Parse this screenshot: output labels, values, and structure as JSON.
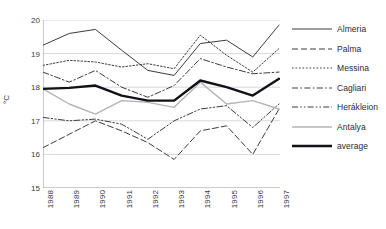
{
  "chart_data": {
    "type": "line",
    "title": "",
    "xlabel": "",
    "ylabel": "°C",
    "ylim": [
      15,
      20
    ],
    "yticks": [
      15,
      16,
      17,
      18,
      19,
      20
    ],
    "grid": true,
    "legend_position": "right",
    "categories": [
      "1988",
      "1989",
      "1990",
      "1991",
      "1992",
      "1993",
      "1994",
      "1995",
      "1996",
      "1997"
    ],
    "series": [
      {
        "name": "Almeria",
        "style": "solid",
        "color": "#3b3b44",
        "width": 1,
        "values": [
          19.25,
          19.6,
          19.72,
          19.1,
          18.5,
          18.35,
          19.3,
          19.4,
          18.9,
          19.85
        ]
      },
      {
        "name": "Palma",
        "style": "dashed",
        "color": "#3b3b44",
        "width": 1,
        "values": [
          16.2,
          16.6,
          17.0,
          16.7,
          16.35,
          15.85,
          16.7,
          16.85,
          16.0,
          17.35
        ]
      },
      {
        "name": "Messina",
        "style": "dotted",
        "color": "#3b3b44",
        "width": 1,
        "values": [
          18.65,
          18.8,
          18.75,
          18.6,
          18.7,
          18.55,
          19.55,
          18.95,
          18.45,
          19.15
        ]
      },
      {
        "name": "Cagliari",
        "style": "dashdot",
        "color": "#3b3b44",
        "width": 1,
        "values": [
          18.45,
          18.15,
          18.5,
          18.0,
          17.7,
          18.05,
          18.85,
          18.6,
          18.4,
          18.45
        ]
      },
      {
        "name": "Herákleion",
        "style": "dashdotdot",
        "color": "#3b3b44",
        "width": 1,
        "values": [
          17.1,
          17.0,
          17.05,
          16.9,
          16.45,
          17.0,
          17.35,
          17.45,
          16.8,
          17.5
        ]
      },
      {
        "name": "Antalya",
        "style": "solid",
        "color": "#b4b4b8",
        "width": 1.4,
        "values": [
          17.95,
          17.5,
          17.2,
          17.6,
          17.55,
          17.4,
          18.15,
          17.5,
          17.6,
          17.35
        ]
      },
      {
        "name": "average",
        "style": "solid",
        "color": "#111118",
        "width": 2.4,
        "values": [
          17.95,
          17.98,
          18.05,
          17.75,
          17.6,
          17.6,
          18.2,
          18.0,
          17.75,
          18.25
        ]
      }
    ]
  },
  "legend": {
    "items": [
      {
        "label": "Almeria"
      },
      {
        "label": "Palma"
      },
      {
        "label": "Messina"
      },
      {
        "label": "Cagliari"
      },
      {
        "label": "Herákleion"
      },
      {
        "label": "Antalya"
      },
      {
        "label": "average"
      }
    ]
  }
}
